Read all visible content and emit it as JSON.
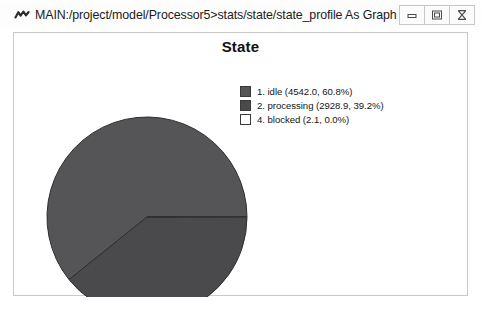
{
  "window": {
    "title": "MAIN:/project/model/Processor5>stats/state/state_profile As Graph",
    "app_icon": "graph-icon",
    "controls": [
      {
        "name": "minimize",
        "icon": "minimize-icon"
      },
      {
        "name": "maximize",
        "icon": "maximize-icon"
      },
      {
        "name": "close",
        "icon": "close-icon"
      }
    ]
  },
  "chart_data": {
    "type": "pie",
    "title": "State",
    "xlabel": "",
    "ylabel": "",
    "legend_position": "top-right",
    "grid": false,
    "categories": [
      "1. idle",
      "2. processing",
      "4. blocked"
    ],
    "values": [
      4542.0,
      2928.9,
      2.1
    ],
    "percents": [
      60.8,
      39.2,
      0.0
    ],
    "colors": [
      "#555557",
      "#4a4a4c",
      "#ffffff"
    ],
    "legend_entries": [
      "1. idle (4542.0, 60.8%)",
      "2. processing (2928.9, 39.2%)",
      "4. blocked (2.1, 0.0%)"
    ],
    "start_angle_deg": 0,
    "direction": "counterclockwise",
    "center": {
      "x": 133,
      "y": 184
    },
    "radius": 100
  }
}
